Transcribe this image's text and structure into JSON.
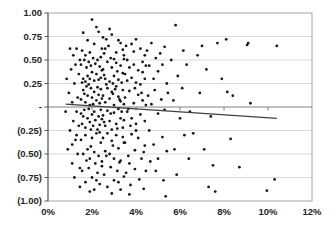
{
  "chart_data": {
    "type": "scatter",
    "title": "",
    "xlabel": "",
    "ylabel": "",
    "legend": "none",
    "grid": "horizontal",
    "x_axis": {
      "min": 0,
      "max": 12,
      "tick_values": [
        0,
        2,
        4,
        6,
        8,
        10,
        12
      ],
      "tick_labels": [
        "0%",
        "2%",
        "4%",
        "6%",
        "8%",
        "10%",
        "12%"
      ],
      "label_position": "low"
    },
    "y_axis": {
      "min": -1,
      "max": 1,
      "tick_values": [
        1,
        0.75,
        0.5,
        0.25,
        0,
        -0.25,
        -0.5,
        -0.75,
        -1
      ],
      "tick_labels": [
        "1.00",
        "0.75",
        "0.50",
        "0.25",
        "-",
        "(0.25)",
        "(0.50)",
        "(0.75)",
        "(1.00)"
      ]
    },
    "trendline": {
      "x1": 0.8,
      "y1": 0.03,
      "x2": 10.4,
      "y2": -0.12
    },
    "colors": {
      "point": "#1a1a1a",
      "gridline": "#d9d9d9",
      "axis": "#808080",
      "axis_dark": "#595959",
      "border": "#a6a6a6",
      "trendline": "#404040",
      "label": "#262626",
      "background": "#ffffff"
    },
    "points": [
      [
        0.8,
        -0.05
      ],
      [
        0.85,
        0.3
      ],
      [
        0.9,
        -0.45
      ],
      [
        0.95,
        0.15
      ],
      [
        1.0,
        0.62
      ],
      [
        1.0,
        -0.25
      ],
      [
        1.05,
        0.4
      ],
      [
        1.1,
        -0.6
      ],
      [
        1.1,
        0.05
      ],
      [
        1.15,
        0.55
      ],
      [
        1.15,
        -0.15
      ],
      [
        1.2,
        0.25
      ],
      [
        1.2,
        -0.75
      ],
      [
        1.25,
        0.45
      ],
      [
        1.25,
        -0.35
      ],
      [
        1.3,
        0.62
      ],
      [
        1.3,
        -0.05
      ],
      [
        1.35,
        0.1
      ],
      [
        1.35,
        -0.5
      ],
      [
        1.4,
        0.35
      ],
      [
        1.4,
        -0.2
      ],
      [
        1.45,
        0.5
      ],
      [
        1.45,
        -0.65
      ],
      [
        1.45,
        -0.85
      ],
      [
        1.3,
        -0.3
      ],
      [
        1.1,
        -0.4
      ],
      [
        2.0,
        0.93
      ],
      [
        2.2,
        0.85
      ],
      [
        1.6,
        0.79
      ],
      [
        2.3,
        0.8
      ],
      [
        2.5,
        0.74
      ],
      [
        1.8,
        0.71
      ],
      [
        2.1,
        0.67
      ],
      [
        1.7,
        0.55
      ],
      [
        2.4,
        0.53
      ],
      [
        1.55,
        0.6
      ],
      [
        2.45,
        0.62
      ],
      [
        1.9,
        0.58
      ],
      [
        1.5,
        0.45
      ],
      [
        1.6,
        0.3
      ],
      [
        1.65,
        0.5
      ],
      [
        1.7,
        0.27
      ],
      [
        1.75,
        0.42
      ],
      [
        1.8,
        0.33
      ],
      [
        1.85,
        0.48
      ],
      [
        1.9,
        0.3
      ],
      [
        1.95,
        0.44
      ],
      [
        2.0,
        0.37
      ],
      [
        2.05,
        0.52
      ],
      [
        2.1,
        0.28
      ],
      [
        2.15,
        0.46
      ],
      [
        2.2,
        0.35
      ],
      [
        2.25,
        0.5
      ],
      [
        2.3,
        0.29
      ],
      [
        2.35,
        0.43
      ],
      [
        2.4,
        0.31
      ],
      [
        2.45,
        0.39
      ],
      [
        1.55,
        0.26
      ],
      [
        1.5,
        0.08
      ],
      [
        1.6,
        0.18
      ],
      [
        1.7,
        0.05
      ],
      [
        1.75,
        0.22
      ],
      [
        1.8,
        0.12
      ],
      [
        1.9,
        0.02
      ],
      [
        1.95,
        0.2
      ],
      [
        2.0,
        0.1
      ],
      [
        2.05,
        0.03
      ],
      [
        2.1,
        0.16
      ],
      [
        2.2,
        0.07
      ],
      [
        2.25,
        0.21
      ],
      [
        2.3,
        0.13
      ],
      [
        2.35,
        0.04
      ],
      [
        2.4,
        0.19
      ],
      [
        2.45,
        0.09
      ],
      [
        1.65,
        0.14
      ],
      [
        1.85,
        0.24
      ],
      [
        1.5,
        -0.07
      ],
      [
        1.55,
        -0.18
      ],
      [
        1.65,
        -0.03
      ],
      [
        1.7,
        -0.22
      ],
      [
        1.8,
        -0.12
      ],
      [
        1.85,
        -0.02
      ],
      [
        1.9,
        -0.16
      ],
      [
        2.0,
        -0.08
      ],
      [
        2.05,
        -0.2
      ],
      [
        2.1,
        -0.05
      ],
      [
        2.15,
        -0.14
      ],
      [
        2.25,
        -0.24
      ],
      [
        2.3,
        -0.1
      ],
      [
        2.35,
        -0.19
      ],
      [
        2.4,
        -0.03
      ],
      [
        2.45,
        -0.13
      ],
      [
        1.95,
        -0.24
      ],
      [
        1.6,
        -0.1
      ],
      [
        1.5,
        -0.35
      ],
      [
        1.6,
        -0.5
      ],
      [
        1.7,
        -0.3
      ],
      [
        1.8,
        -0.45
      ],
      [
        1.9,
        -0.55
      ],
      [
        2.0,
        -0.33
      ],
      [
        2.1,
        -0.48
      ],
      [
        2.2,
        -0.28
      ],
      [
        2.3,
        -0.52
      ],
      [
        2.4,
        -0.38
      ],
      [
        2.45,
        -0.58
      ],
      [
        1.75,
        -0.57
      ],
      [
        1.95,
        -0.42
      ],
      [
        2.15,
        -0.6
      ],
      [
        2.35,
        -0.27
      ],
      [
        1.55,
        -0.68
      ],
      [
        1.7,
        -0.8
      ],
      [
        1.85,
        -0.65
      ],
      [
        2.0,
        -0.75
      ],
      [
        2.1,
        -0.88
      ],
      [
        2.25,
        -0.7
      ],
      [
        2.35,
        -0.82
      ],
      [
        2.45,
        -0.63
      ],
      [
        1.9,
        -0.9
      ],
      [
        2.2,
        -0.78
      ],
      [
        2.8,
        0.83
      ],
      [
        2.9,
        0.77
      ],
      [
        3.2,
        0.71
      ],
      [
        2.6,
        0.62
      ],
      [
        3.4,
        0.61
      ],
      [
        3.0,
        0.51
      ],
      [
        2.55,
        0.57
      ],
      [
        3.45,
        0.55
      ],
      [
        2.75,
        0.65
      ],
      [
        3.1,
        0.58
      ],
      [
        3.3,
        0.68
      ],
      [
        2.65,
        0.72
      ],
      [
        2.5,
        0.4
      ],
      [
        2.6,
        0.3
      ],
      [
        2.7,
        0.48
      ],
      [
        2.8,
        0.27
      ],
      [
        2.9,
        0.42
      ],
      [
        3.0,
        0.33
      ],
      [
        3.1,
        0.47
      ],
      [
        3.2,
        0.29
      ],
      [
        3.3,
        0.44
      ],
      [
        3.4,
        0.36
      ],
      [
        3.45,
        0.51
      ],
      [
        2.55,
        0.34
      ],
      [
        2.85,
        0.52
      ],
      [
        3.15,
        0.38
      ],
      [
        3.35,
        0.26
      ],
      [
        2.95,
        0.25
      ],
      [
        2.5,
        0.12
      ],
      [
        2.6,
        0.05
      ],
      [
        2.7,
        0.2
      ],
      [
        2.8,
        0.09
      ],
      [
        2.9,
        0.16
      ],
      [
        3.0,
        0.02
      ],
      [
        3.1,
        0.22
      ],
      [
        3.2,
        0.11
      ],
      [
        3.3,
        0.06
      ],
      [
        3.4,
        0.18
      ],
      [
        3.45,
        0.03
      ],
      [
        2.65,
        0.24
      ],
      [
        2.95,
        0.14
      ],
      [
        3.25,
        0.08
      ],
      [
        3.05,
        0.19
      ],
      [
        2.5,
        -0.09
      ],
      [
        2.6,
        -0.2
      ],
      [
        2.7,
        -0.04
      ],
      [
        2.8,
        -0.15
      ],
      [
        2.9,
        -0.24
      ],
      [
        3.0,
        -0.06
      ],
      [
        3.1,
        -0.18
      ],
      [
        3.2,
        -0.02
      ],
      [
        3.3,
        -0.12
      ],
      [
        3.4,
        -0.22
      ],
      [
        2.55,
        -0.16
      ],
      [
        2.85,
        -0.07
      ],
      [
        3.15,
        -0.23
      ],
      [
        3.35,
        -0.05
      ],
      [
        3.45,
        -0.14
      ],
      [
        2.5,
        -0.33
      ],
      [
        2.6,
        -0.47
      ],
      [
        2.7,
        -0.28
      ],
      [
        2.8,
        -0.5
      ],
      [
        2.9,
        -0.36
      ],
      [
        3.0,
        -0.55
      ],
      [
        3.1,
        -0.3
      ],
      [
        3.2,
        -0.44
      ],
      [
        3.3,
        -0.57
      ],
      [
        3.4,
        -0.32
      ],
      [
        2.65,
        -0.52
      ],
      [
        2.95,
        -0.41
      ],
      [
        3.25,
        -0.59
      ],
      [
        3.45,
        -0.38
      ],
      [
        2.55,
        -0.72
      ],
      [
        2.7,
        -0.85
      ],
      [
        2.85,
        -0.64
      ],
      [
        3.0,
        -0.78
      ],
      [
        3.15,
        -0.68
      ],
      [
        3.3,
        -0.88
      ],
      [
        3.45,
        -0.74
      ],
      [
        2.9,
        -0.92
      ],
      [
        3.2,
        -0.8
      ],
      [
        3.8,
        0.67
      ],
      [
        3.9,
        0.59
      ],
      [
        3.6,
        0.5
      ],
      [
        4.2,
        0.62
      ],
      [
        4.4,
        0.55
      ],
      [
        3.55,
        0.65
      ],
      [
        4.0,
        0.72
      ],
      [
        4.3,
        0.48
      ],
      [
        3.5,
        0.35
      ],
      [
        3.6,
        0.28
      ],
      [
        3.7,
        0.42
      ],
      [
        3.8,
        0.31
      ],
      [
        3.9,
        0.45
      ],
      [
        4.0,
        0.26
      ],
      [
        4.1,
        0.39
      ],
      [
        4.2,
        0.24
      ],
      [
        4.3,
        0.37
      ],
      [
        4.4,
        0.3
      ],
      [
        4.45,
        0.44
      ],
      [
        3.5,
        0.1
      ],
      [
        3.6,
        -0.05
      ],
      [
        3.7,
        0.17
      ],
      [
        3.8,
        -0.12
      ],
      [
        3.9,
        0.04
      ],
      [
        4.0,
        -0.18
      ],
      [
        4.1,
        0.13
      ],
      [
        4.2,
        -0.08
      ],
      [
        4.3,
        0.07
      ],
      [
        4.4,
        -0.15
      ],
      [
        4.45,
        0.02
      ],
      [
        3.65,
        -0.02
      ],
      [
        3.95,
        0.2
      ],
      [
        4.25,
        0.15
      ],
      [
        3.75,
        -0.2
      ],
      [
        3.5,
        -0.38
      ],
      [
        3.65,
        -0.52
      ],
      [
        3.8,
        -0.29
      ],
      [
        3.95,
        -0.46
      ],
      [
        4.1,
        -0.33
      ],
      [
        4.25,
        -0.55
      ],
      [
        4.4,
        -0.41
      ],
      [
        3.7,
        -0.6
      ],
      [
        4.0,
        -0.25
      ],
      [
        4.35,
        -0.48
      ],
      [
        3.55,
        -0.7
      ],
      [
        3.75,
        -0.83
      ],
      [
        3.95,
        -0.66
      ],
      [
        4.15,
        -0.77
      ],
      [
        4.35,
        -0.87
      ],
      [
        4.45,
        -0.68
      ],
      [
        3.7,
        -0.93
      ],
      [
        4.5,
        0.6
      ],
      [
        4.6,
        0.44
      ],
      [
        4.7,
        0.68
      ],
      [
        4.8,
        0.3
      ],
      [
        4.9,
        0.52
      ],
      [
        5.0,
        0.38
      ],
      [
        5.1,
        0.57
      ],
      [
        5.2,
        0.45
      ],
      [
        5.3,
        0.64
      ],
      [
        5.4,
        0.25
      ],
      [
        4.55,
        0.12
      ],
      [
        4.7,
        0.03
      ],
      [
        4.85,
        0.18
      ],
      [
        5.0,
        -0.07
      ],
      [
        5.15,
        0.08
      ],
      [
        5.3,
        -0.03
      ],
      [
        5.45,
        0.15
      ],
      [
        4.6,
        -0.25
      ],
      [
        4.8,
        -0.4
      ],
      [
        5.0,
        -0.55
      ],
      [
        5.2,
        -0.32
      ],
      [
        5.4,
        -0.47
      ],
      [
        4.9,
        -0.68
      ],
      [
        5.25,
        -0.78
      ],
      [
        5.35,
        -0.95
      ],
      [
        4.65,
        -0.58
      ],
      [
        5.8,
        0.87
      ],
      [
        5.6,
        0.5
      ],
      [
        5.9,
        0.33
      ],
      [
        6.1,
        0.2
      ],
      [
        6.3,
        0.45
      ],
      [
        5.7,
        0.07
      ],
      [
        6.0,
        -0.12
      ],
      [
        6.2,
        -0.3
      ],
      [
        5.75,
        -0.45
      ],
      [
        6.4,
        -0.55
      ],
      [
        5.85,
        -0.72
      ],
      [
        6.15,
        0.6
      ],
      [
        6.45,
        -0.05
      ],
      [
        6.8,
        0.55
      ],
      [
        7.0,
        0.65
      ],
      [
        7.2,
        0.4
      ],
      [
        7.7,
        0.68
      ],
      [
        6.9,
        0.15
      ],
      [
        7.4,
        -0.1
      ],
      [
        6.6,
        -0.28
      ],
      [
        7.1,
        -0.45
      ],
      [
        7.5,
        -0.62
      ],
      [
        7.3,
        -0.85
      ],
      [
        7.9,
        0.3
      ],
      [
        7.6,
        -0.9
      ],
      [
        8.3,
        -0.34
      ],
      [
        8.7,
        -0.64
      ],
      [
        9.05,
        0.66
      ],
      [
        10.4,
        0.65
      ],
      [
        9.95,
        -0.89
      ],
      [
        10.3,
        -0.77
      ],
      [
        8.1,
        0.72
      ],
      [
        9.1,
        0.68
      ],
      [
        9.2,
        0.04
      ],
      [
        8.15,
        0.16
      ],
      [
        8.4,
        0.12
      ]
    ],
    "plot_geometry": {
      "left": 48,
      "right": 312,
      "top": 13,
      "bottom": 201,
      "width_px": 336,
      "height_px": 230
    }
  }
}
